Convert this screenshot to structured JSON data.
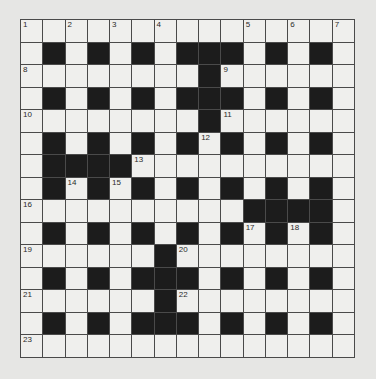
{
  "puzzle": {
    "size": 15,
    "rows": [
      "...............",
      ".#.#.#.###.#.#.",
      "........#......",
      ".#.#.#.###.#.#.",
      "........#......",
      ".#.#.#.#.#.#.#.",
      ".####..........",
      ".#.#.#.#.#.#.#.",
      "..........####.",
      ".#.#.#.#.#.#.#.",
      "......#........",
      ".#.#.###.#.#.#.",
      "......#........",
      ".#.#.###.#.#.#.",
      "..............."
    ],
    "numbers": [
      {
        "n": "1",
        "r": 0,
        "c": 0
      },
      {
        "n": "2",
        "r": 0,
        "c": 2
      },
      {
        "n": "3",
        "r": 0,
        "c": 4
      },
      {
        "n": "4",
        "r": 0,
        "c": 6
      },
      {
        "n": "5",
        "r": 0,
        "c": 10
      },
      {
        "n": "6",
        "r": 0,
        "c": 12
      },
      {
        "n": "7",
        "r": 0,
        "c": 14
      },
      {
        "n": "8",
        "r": 2,
        "c": 0
      },
      {
        "n": "9",
        "r": 2,
        "c": 9
      },
      {
        "n": "10",
        "r": 4,
        "c": 0
      },
      {
        "n": "11",
        "r": 4,
        "c": 9
      },
      {
        "n": "12",
        "r": 5,
        "c": 8
      },
      {
        "n": "13",
        "r": 6,
        "c": 5
      },
      {
        "n": "14",
        "r": 7,
        "c": 2
      },
      {
        "n": "15",
        "r": 7,
        "c": 4
      },
      {
        "n": "16",
        "r": 8,
        "c": 0
      },
      {
        "n": "17",
        "r": 9,
        "c": 10
      },
      {
        "n": "18",
        "r": 9,
        "c": 12
      },
      {
        "n": "19",
        "r": 10,
        "c": 0
      },
      {
        "n": "20",
        "r": 10,
        "c": 7
      },
      {
        "n": "21",
        "r": 12,
        "c": 0
      },
      {
        "n": "22",
        "r": 12,
        "c": 7
      },
      {
        "n": "23",
        "r": 14,
        "c": 0
      }
    ]
  },
  "colors": {
    "background": "#e6e6e4",
    "cell": "#efefed",
    "block": "#1c1c1c",
    "gridline": "#4a4a4a"
  }
}
